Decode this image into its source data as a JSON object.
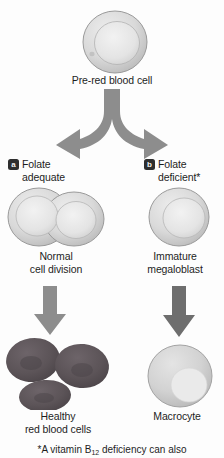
{
  "diagram": {
    "top_cell": {
      "label": "Pre-red blood cell",
      "name": "pre-red-blood-cell"
    },
    "branches": [
      {
        "key": "a",
        "badge": "a",
        "label": "Folate\nadequate",
        "cell_caption": "Normal\ncell division",
        "result_caption": "Healthy\nred blood cells"
      },
      {
        "key": "b",
        "badge": "b",
        "label": "Folate\ndeficient*",
        "cell_caption": "Immature\nmegaloblast",
        "result_caption": "Macrocyte"
      }
    ],
    "footnote": {
      "prefix": "*A vitamin B",
      "subscript": "12",
      "suffix": " deficiency can also"
    },
    "colors": {
      "arrow_gray": "#8d8d8d",
      "arrow_dark_gray": "#6e6e6e",
      "cell_outline": "#9a9a9a",
      "cell_fill": "#d8d8d8",
      "nucleus_fill": "#e8e8e8",
      "rbc_dark": "#5c5458",
      "badge_bg": "#2e2e2e",
      "text": "#1d1d1d"
    }
  }
}
